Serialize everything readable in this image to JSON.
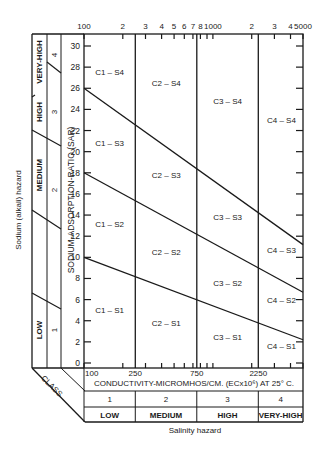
{
  "diagram": {
    "y_axis_label": "SODIUM-ADSORPTION-RATIO (SAR)",
    "x_axis_label": "CONDUCTIVITY-MICROMHOS/CM. (ECx10⁶) AT 25° C.",
    "left_outer_label": "Sodium (alkali) hazard",
    "bottom_outer_label": "Salinity hazard",
    "class_label": "CLASS",
    "top_ticks": [
      {
        "label": "100",
        "value": 100
      },
      {
        "label": "2",
        "value": 200
      },
      {
        "label": "3",
        "value": 300
      },
      {
        "label": "4",
        "value": 400
      },
      {
        "label": "5",
        "value": 500
      },
      {
        "label": "6",
        "value": 600
      },
      {
        "label": "7",
        "value": 700
      },
      {
        "label": "8",
        "value": 800
      },
      {
        "label": "1000",
        "value": 1000
      },
      {
        "label": "2",
        "value": 2000
      },
      {
        "label": "3",
        "value": 3000
      },
      {
        "label": "4",
        "value": 4000
      },
      {
        "label": "5000",
        "value": 5000
      }
    ],
    "bottom_ticks": [
      {
        "label": "100",
        "value": 100
      },
      {
        "label": "250",
        "value": 250
      },
      {
        "label": "750",
        "value": 750
      },
      {
        "label": "2250",
        "value": 2250
      }
    ],
    "sar_ticks": [
      "0",
      "2",
      "4",
      "6",
      "8",
      "10",
      "12",
      "14",
      "16",
      "18",
      "20",
      "22",
      "24",
      "26",
      "28",
      "30"
    ],
    "sar_range": [
      0,
      30
    ],
    "conductivity_range": [
      100,
      5000
    ],
    "salinity_boundaries": [
      250,
      750,
      2250
    ],
    "salinity_classes": [
      {
        "number": "1",
        "name": "LOW"
      },
      {
        "number": "2",
        "name": "MEDIUM"
      },
      {
        "number": "3",
        "name": "HIGH"
      },
      {
        "number": "4",
        "name": "VERY-HIGH"
      }
    ],
    "sodium_classes": [
      {
        "number": "1",
        "name": "LOW"
      },
      {
        "number": "2",
        "name": "MEDIUM"
      },
      {
        "number": "3",
        "name": "HIGH"
      },
      {
        "number": "4",
        "name": "VERY-HIGH"
      }
    ],
    "sodium_boundaries": [
      {
        "name": "S2/S1",
        "sar_at_100": 10,
        "sar_at_5000": 2.2
      },
      {
        "name": "S3/S2",
        "sar_at_100": 18,
        "sar_at_5000": 6.7
      },
      {
        "name": "S4/S3",
        "sar_at_100": 26,
        "sar_at_5000": 11.2
      }
    ],
    "zones": [
      {
        "label": "C1 – S4",
        "ec": 158,
        "sar": 27.5
      },
      {
        "label": "C1 – S3",
        "ec": 158,
        "sar": 20.8
      },
      {
        "label": "C1 – S2",
        "ec": 158,
        "sar": 13.2
      },
      {
        "label": "C1 – S1",
        "ec": 158,
        "sar": 5.0
      },
      {
        "label": "C2 – S4",
        "ec": 435,
        "sar": 26.5
      },
      {
        "label": "C2 – S3",
        "ec": 435,
        "sar": 17.8
      },
      {
        "label": "C2 – S2",
        "ec": 435,
        "sar": 10.5
      },
      {
        "label": "C2 – S1",
        "ec": 435,
        "sar": 3.8
      },
      {
        "label": "C3 – S4",
        "ec": 1300,
        "sar": 24.8
      },
      {
        "label": "C3 – S3",
        "ec": 1300,
        "sar": 13.8
      },
      {
        "label": "C3 – S2",
        "ec": 1300,
        "sar": 7.6
      },
      {
        "label": "C3 – S1",
        "ec": 1300,
        "sar": 2.5
      },
      {
        "label": "C4 – S4",
        "ec": 3400,
        "sar": 23.0
      },
      {
        "label": "C4 – S3",
        "ec": 3400,
        "sar": 10.7
      },
      {
        "label": "C4 – S2",
        "ec": 3400,
        "sar": 6.0
      },
      {
        "label": "C4 – S1",
        "ec": 3400,
        "sar": 1.6
      }
    ]
  }
}
